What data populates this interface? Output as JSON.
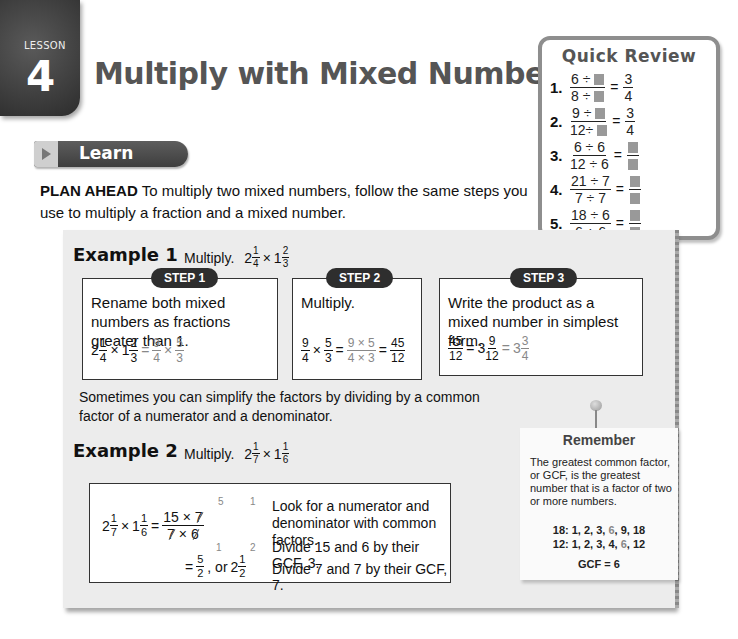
{
  "header": {
    "lesson_label": "LESSON",
    "lesson_number": "4",
    "title": "Multiply with Mixed Numbers"
  },
  "learn": {
    "banner_label": "Learn",
    "plan_ahead_label": "PLAN AHEAD",
    "plan_ahead_text": " To multiply two mixed numbers, follow the same steps you use to multiply a fraction and a mixed number."
  },
  "quick_review": {
    "title": "Quick Review",
    "items": [
      {
        "num": "1.",
        "lhs_num": "6 ÷",
        "lhs_den": "8 ÷",
        "rhs_num": "3",
        "rhs_den": "4",
        "rhs_blank": false
      },
      {
        "num": "2.",
        "lhs_num": "9 ÷",
        "lhs_den": "12÷",
        "rhs_num": "3",
        "rhs_den": "4",
        "rhs_blank": false
      },
      {
        "num": "3.",
        "lhs_num": "6 ÷ 6",
        "lhs_den": "12 ÷ 6",
        "rhs_blank": true
      },
      {
        "num": "4.",
        "lhs_num": "21 ÷ 7",
        "lhs_den": "7 ÷ 7",
        "rhs_blank": true
      },
      {
        "num": "5.",
        "lhs_num": "18 ÷ 6",
        "lhs_den": "6 ÷ 6",
        "rhs_blank": true
      }
    ]
  },
  "example1": {
    "heading": "Example 1",
    "prompt": "Multiply.",
    "problem": {
      "a_whole": "2",
      "a_num": "1",
      "a_den": "4",
      "op": "×",
      "b_whole": "1",
      "b_num": "2",
      "b_den": "3"
    },
    "steps": [
      {
        "label": "STEP 1",
        "text": "Rename both mixed numbers as fractions greater than 1.",
        "math": {
          "a_whole": "2",
          "a_num": "1",
          "a_den": "4",
          "b_whole": "1",
          "b_num": "2",
          "b_den": "3",
          "r1_num": "9",
          "r1_den": "4",
          "r2_num": "5",
          "r2_den": "3"
        }
      },
      {
        "label": "STEP 2",
        "text": "Multiply.",
        "math": {
          "f1_num": "9",
          "f1_den": "4",
          "f2_num": "5",
          "f2_den": "3",
          "p_num": "9 × 5",
          "p_den": "4 × 3",
          "r_num": "45",
          "r_den": "12"
        }
      },
      {
        "label": "STEP 3",
        "text": "Write the product as a mixed number in simplest form.",
        "math": {
          "f_num": "45",
          "f_den": "12",
          "m1_whole": "3",
          "m1_num": "9",
          "m1_den": "12",
          "m2_whole": "3",
          "m2_num": "3",
          "m2_den": "4"
        }
      }
    ]
  },
  "simplify_note": "Sometimes you can simplify the factors by dividing by a common factor of a numerator and a denominator.",
  "example2": {
    "heading": "Example 2",
    "prompt": "Multiply.",
    "problem": {
      "a_whole": "2",
      "a_num": "1",
      "a_den": "7",
      "op": "×",
      "b_whole": "1",
      "b_num": "1",
      "b_den": "6"
    },
    "work": {
      "num_expr_a": "15",
      "num_expr_b": "7",
      "den_expr_a": "7",
      "den_expr_b": "6",
      "above_a": "5",
      "above_b": "1",
      "below_a": "1",
      "below_b": "2",
      "result_num": "5",
      "result_den": "2",
      "or_text": ", or",
      "result_whole": "2",
      "result_mnum": "1",
      "result_mden": "2"
    },
    "explanations": [
      "Look for a numerator and denominator with common factors.",
      "Divide 15 and 6 by their GCF, 3.",
      "Divide 7 and 7 by their GCF, 7."
    ]
  },
  "remember": {
    "title": "Remember",
    "body": "The greatest common factor, or GCF, is the greatest number that is a factor of two or more numbers.",
    "factors_18_label": "18:",
    "factors_18": [
      "1",
      "2",
      "3",
      "6",
      "9",
      "18"
    ],
    "factors_12_label": "12:",
    "factors_12": [
      "1",
      "2",
      "3",
      "4",
      "6",
      "12"
    ],
    "gcf_line": "GCF = 6"
  },
  "colors": {
    "dark_gray": "#3e3e3e",
    "title_gray": "#555555",
    "panel_bg": "#ececec",
    "highlight_gray": "#888888"
  }
}
